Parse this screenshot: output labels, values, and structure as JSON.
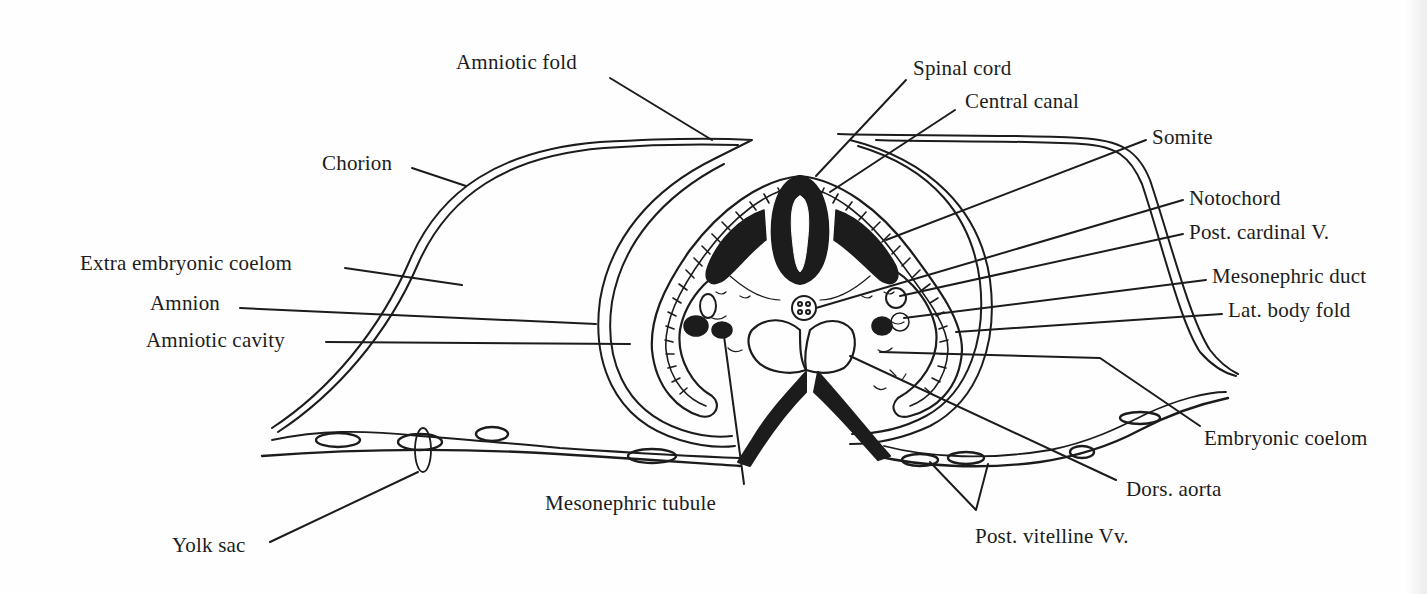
{
  "figure": {
    "ink_color": "#1c1c1c",
    "paper_color": "#fefefe"
  },
  "labels": {
    "amniotic_fold": "Amniotic fold",
    "spinal_cord": "Spinal cord",
    "central_canal": "Central canal",
    "somite": "Somite",
    "notochord": "Notochord",
    "post_cardinal_v": "Post. cardinal V.",
    "mesonephric_duct": "Mesonephric duct",
    "lat_body_fold": "Lat. body fold",
    "chorion": "Chorion",
    "extra_embryonic_coelom": "Extra embryonic coelom",
    "amnion": "Amnion",
    "amniotic_cavity": "Amniotic cavity",
    "embryonic_coelom": "Embryonic coelom",
    "dors_aorta": "Dors. aorta",
    "post_vitelline_vv": "Post. vitelline Vv.",
    "mesonephric_tubule": "Mesonephric tubule",
    "yolk_sac": "Yolk sac"
  }
}
